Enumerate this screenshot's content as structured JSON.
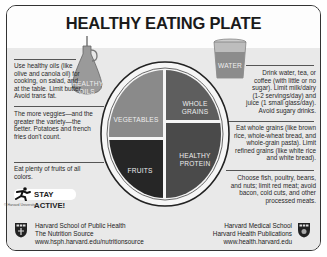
{
  "title": "HEALTHY EATING PLATE",
  "left": {
    "oils": "Use healthy oils (like olive and canola oil) for cooking, on salad, and at the table. Limit butter. Avoid trans fat.",
    "veggies": "The more veggies—and the greater the variety—the better. Potatoes and french fries don't count.",
    "fruits": "Eat plenty of fruits of all colors."
  },
  "right": {
    "water": "Drink water, tea, or coffee (with little or no sugar). Limit milk/dairy (1-2 servings/day) and juice (1 small glass/day). Avoid sugary drinks.",
    "grains": "Eat whole grains (like brown rice, whole-wheat bread, and whole-grain pasta). Limit refined grains (like white rice and white bread).",
    "protein": "Choose fish, poultry, beans, and nuts; limit red meat; avoid bacon, cold cuts, and other processed meats."
  },
  "plate": {
    "vegetables": "VEGETABLES",
    "whole_grains_1": "WHOLE",
    "whole_grains_2": "GRAINS",
    "protein_1": "HEALTHY",
    "protein_2": "PROTEIN",
    "fruits": "FRUITS"
  },
  "oil_label_1": "HEALTHY",
  "oil_label_2": "OILS",
  "water_label": "WATER",
  "stay_active": "STAY ACTIVE!",
  "copyright": "© Harvard University",
  "footer": {
    "left_1": "Harvard School of Public Health",
    "left_2": "The Nutrition Source",
    "left_3": "www.hsph.harvard.edu/nutritionsource",
    "right_1": "Harvard Medical School",
    "right_2": "Harvard Health Publications",
    "right_3": "www.health.harvard.edu"
  },
  "colors": {
    "vegetables": "#8a8a8a",
    "grains": "#5e5e5e",
    "protein": "#4a4a4a",
    "fruits": "#262626",
    "band": "#e9e9e9"
  }
}
